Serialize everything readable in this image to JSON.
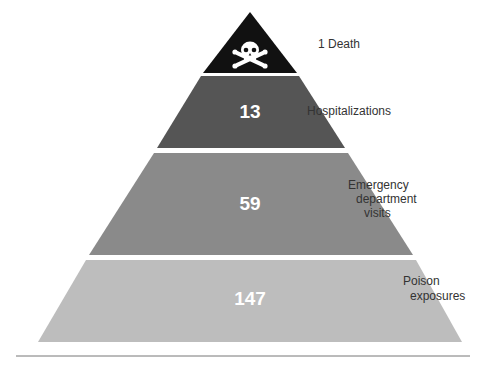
{
  "diagram": {
    "type": "pyramid",
    "tiers": [
      {
        "value": "",
        "label": "1 Death",
        "icon": "skull-crossbones-icon",
        "color": "#111111"
      },
      {
        "value": "13",
        "label": "Hospitalizations",
        "color": "#555555"
      },
      {
        "value": "59",
        "label_lines": [
          "Emergency",
          "department",
          "visits"
        ],
        "color": "#8a8a8a"
      },
      {
        "value": "147",
        "label_lines": [
          "Poison",
          "exposures"
        ],
        "color": "#bdbdbd"
      }
    ]
  }
}
